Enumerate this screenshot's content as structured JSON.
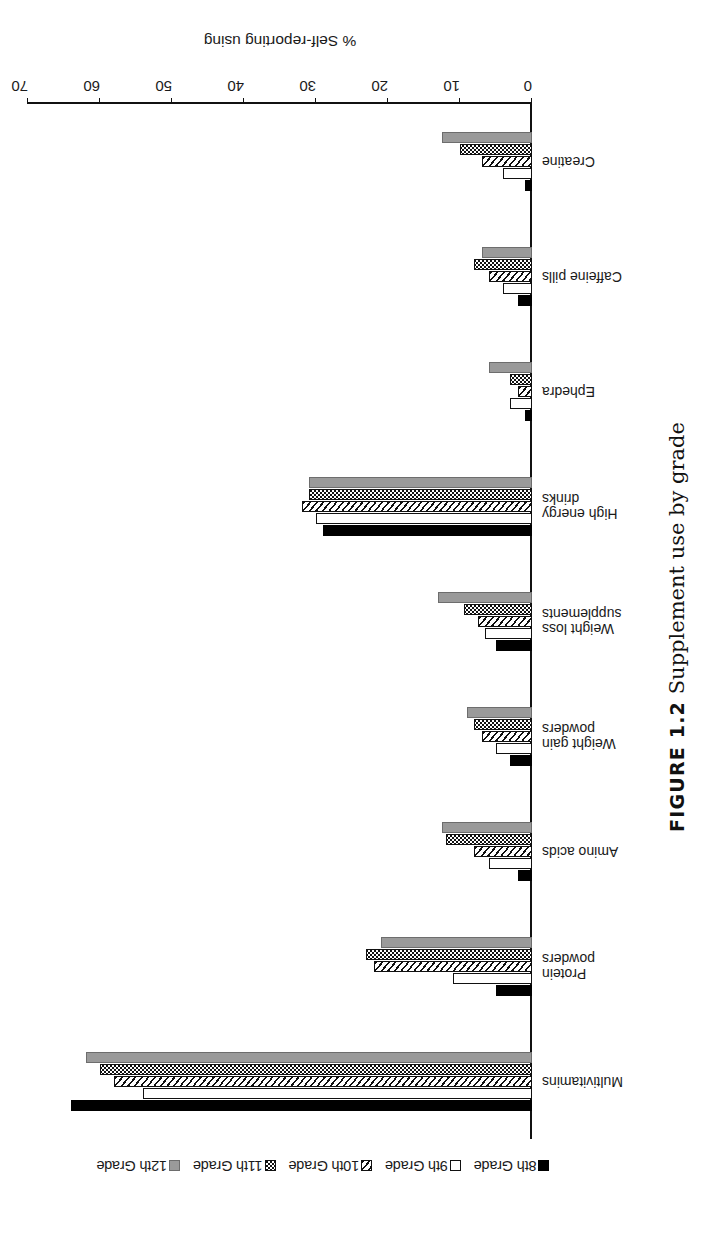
{
  "figure": {
    "number_label": "FIGURE 1.2",
    "caption_text": "Supplement use by grade"
  },
  "chart_data": {
    "type": "bar",
    "orientation": "horizontal",
    "title": "",
    "xlabel": "% Self-reporting using",
    "ylabel": "",
    "xlim": [
      0,
      70
    ],
    "xticks": [
      0,
      10,
      20,
      30,
      40,
      50,
      60,
      70
    ],
    "grid": false,
    "legend_position": "top",
    "categories": [
      "Multivitamins",
      "Protein powders",
      "Amino acids",
      "Weight gain\npowders",
      "Weight loss\nsupplements",
      "High energy\ndrinks",
      "Ephedra",
      "Caffeine pills",
      "Creatine"
    ],
    "series": [
      {
        "name": "8th Grade",
        "pattern": "solid",
        "values": [
          64,
          5,
          2,
          3,
          5,
          29,
          1,
          2,
          1
        ]
      },
      {
        "name": "9th Grade",
        "pattern": "open",
        "values": [
          54,
          11,
          6,
          5,
          6.5,
          30,
          3,
          4,
          4
        ]
      },
      {
        "name": "10th Grade",
        "pattern": "diagonal",
        "values": [
          58,
          22,
          8,
          7,
          7.5,
          32,
          2,
          6,
          7
        ]
      },
      {
        "name": "11th Grade",
        "pattern": "dotted",
        "values": [
          60,
          23,
          12,
          8,
          9.5,
          31,
          3,
          8,
          10
        ]
      },
      {
        "name": "12th Grade",
        "pattern": "gray",
        "values": [
          62,
          21,
          12.5,
          9,
          13,
          31,
          6,
          7,
          12.5
        ]
      }
    ]
  },
  "legend": {
    "items": [
      {
        "label": "8th Grade",
        "pattern": "solid"
      },
      {
        "label": "9th Grade",
        "pattern": "open"
      },
      {
        "label": "10th Grade",
        "pattern": "diagonal"
      },
      {
        "label": "11th Grade",
        "pattern": "dotted"
      },
      {
        "label": "12th Grade",
        "pattern": "gray"
      }
    ]
  },
  "colors": {
    "ink": "#111111",
    "gray_series": "#9a9a9a",
    "background": "#ffffff"
  }
}
